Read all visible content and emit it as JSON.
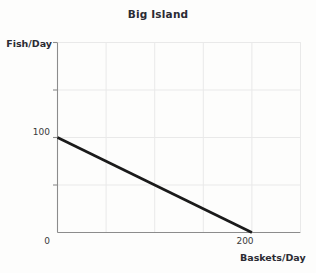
{
  "chart_data": {
    "type": "line",
    "title": "Big Island",
    "xlabel": "Baskets/Day",
    "ylabel": "Fish/Day",
    "x": [
      0,
      200
    ],
    "values": [
      100,
      0
    ],
    "series": [
      {
        "name": "Production Possibilities Frontier",
        "x": [
          0,
          200
        ],
        "values": [
          100,
          0
        ],
        "color": "#1a1a1a"
      }
    ],
    "xlim": [
      0,
      250
    ],
    "ylim": [
      0,
      200
    ],
    "xticks": [
      0,
      200
    ],
    "xtick_labels": [
      "0",
      "200"
    ],
    "yticks": [
      100
    ],
    "ytick_labels": [
      "100"
    ],
    "gridlines_x": [
      0,
      50,
      100,
      150,
      200,
      250
    ],
    "gridlines_y": [
      0,
      50,
      100,
      150,
      200
    ],
    "grid": true,
    "legend": "none",
    "grid_color": "#e9e9e9",
    "axis_color": "#8c8c8c",
    "background": "#fdfdfc"
  },
  "labels": {
    "title": "Big Island",
    "y_axis": "Fish/Day",
    "x_axis": "Baskets/Day",
    "y_tick_100": "100",
    "x_tick_0": "0",
    "x_tick_200": "200"
  }
}
